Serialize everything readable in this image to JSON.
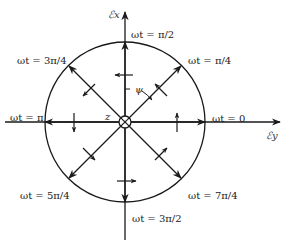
{
  "diagram": {
    "type": "polarization-rotation",
    "axes": {
      "vertical_label": "ℰx",
      "horizontal_label": "ℰy",
      "center_label": "z",
      "angle_label": "ψ"
    },
    "phase_labels": {
      "p0": "ωt = 0",
      "p1": "ωt = π/4",
      "p2": "ωt = π/2",
      "p3": "ωt = 3π/4",
      "p4": "ωt = π",
      "p5": "ωt = 5π/4",
      "p6": "ωt = 3π/2",
      "p7": "ωt = 7π/4"
    },
    "colors": {
      "ink": "#1a1a1a",
      "background": "#ffffff"
    }
  }
}
